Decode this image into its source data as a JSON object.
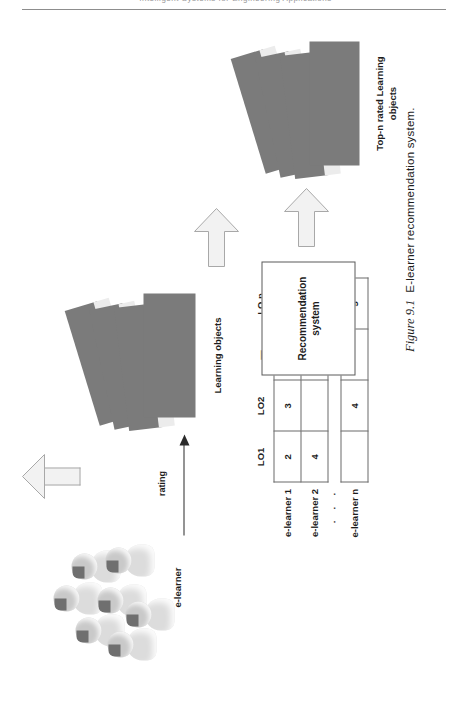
{
  "page": {
    "header_text": "Intelligent Systems for Engineering Applications",
    "caption_number": "Figure 9.1",
    "caption_text": "E-learner recommendation system."
  },
  "figure": {
    "actors": {
      "e_learner_label": "e-learner",
      "rating_label": "rating",
      "learning_objects_label": "Learning objects",
      "topn_label_line1": "Top-n  rated Learning",
      "topn_label_line2": "objects"
    },
    "recsys_box": {
      "line1": "Recommendation",
      "line2": "system"
    },
    "matrix": {
      "column_headers": [
        "LO1",
        "LO2",
        "—",
        "LO n"
      ],
      "rows": [
        {
          "label": "e-learner 1",
          "values": [
            "2",
            "3",
            "",
            "1"
          ]
        },
        {
          "label": "e-learner 2",
          "values": [
            "4",
            "",
            "",
            ""
          ]
        },
        {
          "label": "·  ·  ·",
          "values": [
            "",
            "",
            "",
            ""
          ]
        },
        {
          "label": "e-learner n",
          "values": [
            "",
            "4",
            "",
            "5"
          ]
        }
      ]
    },
    "icons": {
      "arrow_matrix": "block-arrow-up-icon",
      "arrow_recsys": "block-arrow-right-icon",
      "arrow_topn": "block-arrow-right-icon",
      "rating_arrow": "thin-arrow-right-icon",
      "people": "people-cluster-icon",
      "card_stack": "document-stack-icon"
    },
    "colors": {
      "card_dark": "#7b7b7b",
      "card_light": "#ececec",
      "arrow_fill": "#f2f2f2",
      "arrow_stroke": "#a8a8a8",
      "rule": "#8d8d8d",
      "text": "#1d1d1d"
    }
  }
}
